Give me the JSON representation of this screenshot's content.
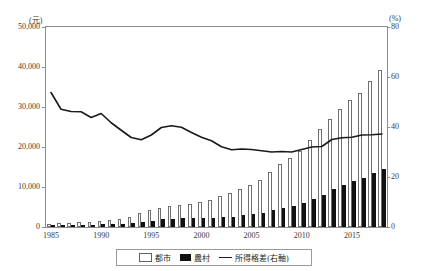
{
  "chart_data": {
    "type": "bar",
    "title": "",
    "subtitle": "",
    "xlabel": "",
    "ylabel": "(元)",
    "y2label": "(%)",
    "ylim": [
      0,
      50000
    ],
    "y2lim": [
      0,
      80
    ],
    "grid": false,
    "legend_position": "bottom-center",
    "y_ticks": [
      "0",
      "10,000",
      "20,000",
      "30,000",
      "40,000",
      "50,000"
    ],
    "y_tick_values": [
      0,
      10000,
      20000,
      30000,
      40000,
      50000
    ],
    "y2_ticks": [
      "0",
      "20",
      "40",
      "60",
      "80"
    ],
    "y2_tick_values": [
      0,
      20,
      40,
      60,
      80
    ],
    "x_ticks": [
      "1985",
      "1990",
      "1995",
      "2000",
      "2005",
      "2010",
      "2015"
    ],
    "x_tick_values": [
      1985,
      1990,
      1995,
      2000,
      2005,
      2010,
      2015
    ],
    "categories": [
      1985,
      1986,
      1987,
      1988,
      1989,
      1990,
      1991,
      1992,
      1993,
      1994,
      1995,
      1996,
      1997,
      1998,
      1999,
      2000,
      2001,
      2002,
      2003,
      2004,
      2005,
      2006,
      2007,
      2008,
      2009,
      2010,
      2011,
      2012,
      2013,
      2014,
      2015,
      2016,
      2017,
      2018
    ],
    "series": [
      {
        "name": "都市",
        "kind": "bar",
        "axis": "left",
        "color": "#ffffff",
        "edge_color": "#6f6f6f",
        "values": [
          740,
          900,
          1002,
          1181,
          1374,
          1510,
          1700,
          2027,
          2577,
          3496,
          4283,
          4839,
          5160,
          5425,
          5854,
          6280,
          6860,
          7703,
          8472,
          9422,
          10493,
          11760,
          13786,
          15781,
          17175,
          19109,
          21810,
          24565,
          26955,
          29381,
          31790,
          33616,
          36396,
          39251
        ]
      },
      {
        "name": "農村",
        "kind": "bar",
        "axis": "left",
        "color": "#111111",
        "edge_color": "#111111",
        "values": [
          398,
          424,
          463,
          545,
          602,
          686,
          709,
          784,
          922,
          1221,
          1578,
          1926,
          2090,
          2162,
          2210,
          2253,
          2366,
          2476,
          2622,
          2936,
          3255,
          3587,
          4140,
          4761,
          5153,
          5919,
          6977,
          7917,
          9430,
          10489,
          11422,
          12363,
          13432,
          14617
        ]
      },
      {
        "name": "所得格差(右軸)",
        "kind": "line",
        "axis": "right",
        "color": "#1a1a1a",
        "values": [
          53.8,
          47.1,
          46.2,
          46.1,
          43.8,
          45.4,
          41.7,
          38.7,
          35.8,
          34.9,
          36.8,
          39.8,
          40.5,
          39.9,
          37.8,
          35.9,
          34.5,
          32.1,
          30.9,
          31.2,
          31.0,
          30.5,
          30.0,
          30.2,
          30.0,
          31.0,
          32.0,
          32.2,
          35.0,
          35.7,
          35.9,
          36.8,
          36.9,
          37.2
        ]
      }
    ]
  },
  "legend": {
    "items": [
      {
        "label": "都市",
        "marker": "white-bar-swatch"
      },
      {
        "label": "農村",
        "marker": "black-bar-swatch"
      },
      {
        "label": "所得格差(右軸)",
        "marker": "line-swatch"
      }
    ]
  }
}
